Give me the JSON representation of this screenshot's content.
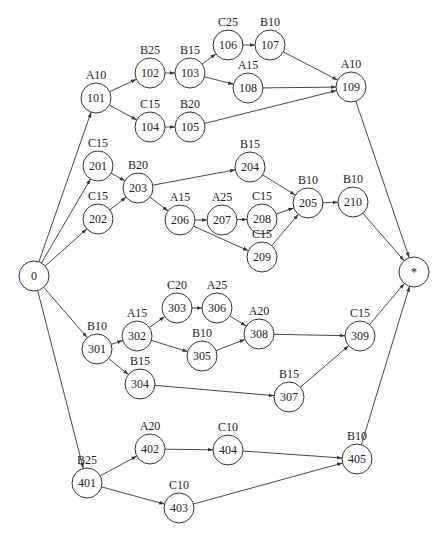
{
  "diagram": {
    "type": "activity-network",
    "node_radius": 15,
    "colors": {
      "stroke": "#333333",
      "background": "#ffffff",
      "text": "#222222"
    },
    "nodes": [
      {
        "id": "0",
        "label": "",
        "x": 34,
        "y": 276
      },
      {
        "id": "101",
        "label": "A10",
        "x": 96,
        "y": 98
      },
      {
        "id": "102",
        "label": "B25",
        "x": 150,
        "y": 73
      },
      {
        "id": "103",
        "label": "B15",
        "x": 190,
        "y": 73
      },
      {
        "id": "104",
        "label": "C15",
        "x": 150,
        "y": 127
      },
      {
        "id": "105",
        "label": "B20",
        "x": 190,
        "y": 127
      },
      {
        "id": "106",
        "label": "C25",
        "x": 228,
        "y": 45
      },
      {
        "id": "107",
        "label": "B10",
        "x": 270,
        "y": 45
      },
      {
        "id": "108",
        "label": "A15",
        "x": 248,
        "y": 88
      },
      {
        "id": "109",
        "label": "A10",
        "x": 351,
        "y": 87
      },
      {
        "id": "201",
        "label": "C15",
        "x": 98,
        "y": 166
      },
      {
        "id": "202",
        "label": "C15",
        "x": 98,
        "y": 219
      },
      {
        "id": "203",
        "label": "B20",
        "x": 138,
        "y": 188
      },
      {
        "id": "204",
        "label": "B15",
        "x": 250,
        "y": 167
      },
      {
        "id": "206",
        "label": "A15",
        "x": 180,
        "y": 220
      },
      {
        "id": "207",
        "label": "A25",
        "x": 222,
        "y": 220
      },
      {
        "id": "208",
        "label": "C15",
        "x": 262,
        "y": 219
      },
      {
        "id": "209",
        "label": "C15",
        "x": 262,
        "y": 257
      },
      {
        "id": "205",
        "label": "B10",
        "x": 308,
        "y": 203
      },
      {
        "id": "210",
        "label": "B10",
        "x": 353,
        "y": 202
      },
      {
        "id": "301",
        "label": "B10",
        "x": 97,
        "y": 349
      },
      {
        "id": "302",
        "label": "A15",
        "x": 137,
        "y": 336
      },
      {
        "id": "303",
        "label": "C20",
        "x": 177,
        "y": 308
      },
      {
        "id": "306",
        "label": "A25",
        "x": 217,
        "y": 308
      },
      {
        "id": "305",
        "label": "B10",
        "x": 202,
        "y": 356
      },
      {
        "id": "308",
        "label": "A20",
        "x": 259,
        "y": 334
      },
      {
        "id": "304",
        "label": "B15",
        "x": 140,
        "y": 384
      },
      {
        "id": "307",
        "label": "B15",
        "x": 289,
        "y": 397
      },
      {
        "id": "309",
        "label": "C15",
        "x": 360,
        "y": 336
      },
      {
        "id": "401",
        "label": "B25",
        "x": 87,
        "y": 483
      },
      {
        "id": "402",
        "label": "A20",
        "x": 150,
        "y": 449
      },
      {
        "id": "404",
        "label": "C10",
        "x": 228,
        "y": 450
      },
      {
        "id": "403",
        "label": "C10",
        "x": 179,
        "y": 508
      },
      {
        "id": "405",
        "label": "B10",
        "x": 357,
        "y": 459
      },
      {
        "id": "*",
        "label": "",
        "x": 414,
        "y": 272
      }
    ],
    "edges": [
      [
        "0",
        "101"
      ],
      [
        "0",
        "201"
      ],
      [
        "0",
        "202"
      ],
      [
        "0",
        "301"
      ],
      [
        "0",
        "401"
      ],
      [
        "101",
        "102"
      ],
      [
        "101",
        "104"
      ],
      [
        "102",
        "103"
      ],
      [
        "103",
        "106"
      ],
      [
        "103",
        "108"
      ],
      [
        "106",
        "107"
      ],
      [
        "107",
        "109"
      ],
      [
        "108",
        "109"
      ],
      [
        "104",
        "105"
      ],
      [
        "105",
        "109"
      ],
      [
        "201",
        "203"
      ],
      [
        "202",
        "203"
      ],
      [
        "203",
        "204"
      ],
      [
        "203",
        "206"
      ],
      [
        "206",
        "207"
      ],
      [
        "206",
        "209"
      ],
      [
        "207",
        "208"
      ],
      [
        "208",
        "205"
      ],
      [
        "209",
        "205"
      ],
      [
        "204",
        "205"
      ],
      [
        "205",
        "210"
      ],
      [
        "301",
        "302"
      ],
      [
        "301",
        "304"
      ],
      [
        "302",
        "303"
      ],
      [
        "302",
        "305"
      ],
      [
        "303",
        "306"
      ],
      [
        "306",
        "308"
      ],
      [
        "305",
        "308"
      ],
      [
        "308",
        "309"
      ],
      [
        "304",
        "307"
      ],
      [
        "307",
        "309"
      ],
      [
        "401",
        "402"
      ],
      [
        "401",
        "403"
      ],
      [
        "402",
        "404"
      ],
      [
        "404",
        "405"
      ],
      [
        "403",
        "405"
      ],
      [
        "109",
        "*"
      ],
      [
        "210",
        "*"
      ],
      [
        "309",
        "*"
      ],
      [
        "405",
        "*"
      ]
    ]
  }
}
